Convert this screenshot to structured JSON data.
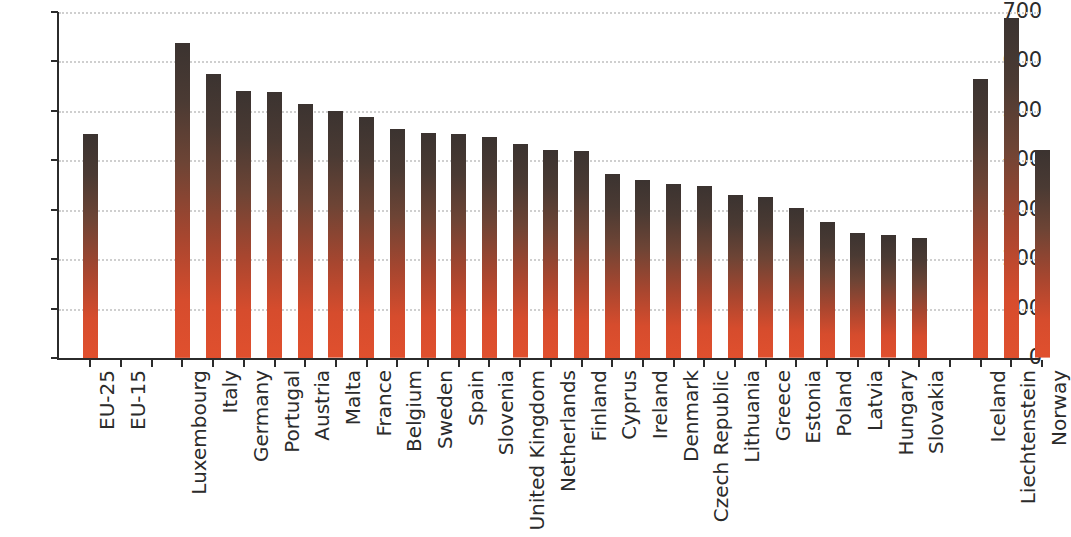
{
  "chart_data": {
    "type": "bar",
    "title": "",
    "subtitle": "",
    "xlabel": "",
    "ylabel": "",
    "ylim": [
      0,
      700
    ],
    "yticks": [
      0,
      100,
      200,
      300,
      400,
      500,
      600,
      700
    ],
    "grid": true,
    "grid_axis": "y",
    "grid_style": "dotted",
    "legend": "none",
    "bar_gradient_top_color": "#3b3330",
    "bar_gradient_bottom_color": "#e0502e",
    "categories": [
      "EU-25",
      "EU-15",
      "",
      "Luxembourg",
      "Italy",
      "Germany",
      "Portugal",
      "Austria",
      "Malta",
      "France",
      "Belgium",
      "Sweden",
      "Spain",
      "Slovenia",
      "United Kingdom",
      "Netherlands",
      "Finland",
      "Cyprus",
      "Ireland",
      "Denmark",
      "Czech Republic",
      "Lithuania",
      "Greece",
      "Estonia",
      "Poland",
      "Latvia",
      "Hungary",
      "Slovakia",
      "",
      "Iceland",
      "Liechtenstein",
      "Norway"
    ],
    "values": [
      454,
      null,
      null,
      637,
      575,
      540,
      538,
      514,
      499,
      488,
      463,
      455,
      454,
      447,
      432,
      421,
      419,
      373,
      361,
      353,
      348,
      330,
      325,
      303,
      276,
      252,
      248,
      243,
      null,
      565,
      688,
      420
    ],
    "value_labels_shown": false
  },
  "axes": {
    "y_tick_labels": [
      "700",
      "600",
      "500",
      "400",
      "300",
      "200",
      "100",
      "0"
    ]
  }
}
